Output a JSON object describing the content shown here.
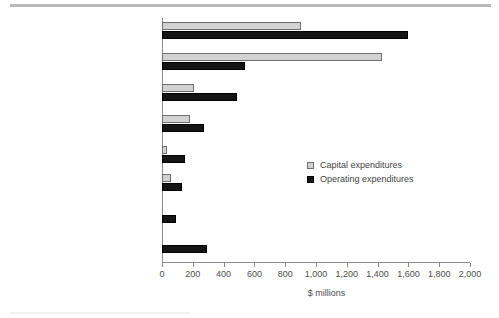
{
  "chart_data": {
    "type": "bar",
    "orientation": "horizontal",
    "title": "",
    "xlabel": "$ millions",
    "ylabel": "",
    "xlim": [
      0,
      2000
    ],
    "xticks": [
      0,
      200,
      400,
      600,
      800,
      1000,
      1200,
      1400,
      1600,
      1800,
      2000
    ],
    "xtick_labels": [
      "0",
      "200",
      "400",
      "600",
      "800",
      "1,000",
      "1,200",
      "1,400",
      "1,600",
      "1,800",
      "2,000"
    ],
    "grid": false,
    "legend_position": "center-right",
    "categories": [
      "Pollution abatement and\ncontrol processes (end-of-pipe)",
      "Pollution prevention processes",
      "Reclamation and\ndecommissioning",
      "Environmental monitoring",
      "Wildlife and habitat\nprotection",
      "Environmental assessments\nand audits",
      "Fees, fines and licences",
      "Other"
    ],
    "series": [
      {
        "name": "Capital expenditures",
        "color": "#d2d2d2",
        "values": [
          900,
          1430,
          210,
          180,
          30,
          60,
          0,
          0
        ]
      },
      {
        "name": "Operating expenditures",
        "color": "#141414",
        "values": [
          1600,
          540,
          490,
          270,
          150,
          130,
          90,
          290
        ]
      }
    ]
  },
  "legend": {
    "items": [
      {
        "label": "Capital expenditures"
      },
      {
        "label": "Operating expenditures"
      }
    ]
  },
  "colors": {
    "capital": "#d2d2d2",
    "operating": "#141414",
    "axis": "#8a8a8a",
    "text": "#444444",
    "rule": "#b9b9b9"
  }
}
